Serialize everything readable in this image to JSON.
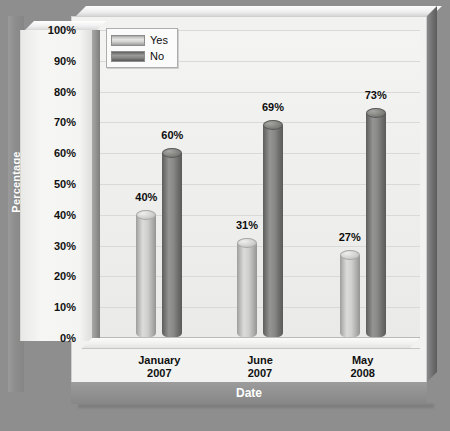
{
  "chart_data": {
    "type": "bar",
    "title": "",
    "xlabel": "Date",
    "ylabel": "Percentage",
    "categories": [
      "January\n2007",
      "June\n2007",
      "May\n2008"
    ],
    "category_lines": [
      [
        "January",
        "2007"
      ],
      [
        "June",
        "2007"
      ],
      [
        "May",
        "2008"
      ]
    ],
    "series": [
      {
        "name": "Yes",
        "values": [
          40,
          31,
          27
        ],
        "value_labels": [
          "40%",
          "31%",
          "27%"
        ],
        "color": "#cfcfcd"
      },
      {
        "name": "No",
        "values": [
          60,
          69,
          73
        ],
        "value_labels": [
          "60%",
          "69%",
          "73%"
        ],
        "color": "#7a7a78"
      }
    ],
    "ylim": [
      0,
      100
    ],
    "ytick_values": [
      0,
      10,
      20,
      30,
      40,
      50,
      60,
      70,
      80,
      90,
      100
    ],
    "ytick_labels": [
      "0%",
      "10%",
      "20%",
      "30%",
      "40%",
      "50%",
      "60%",
      "70%",
      "80%",
      "90%",
      "100%"
    ],
    "grid": true,
    "legend_position": "top-left",
    "style": "3d-cylinder-grayscale"
  },
  "legend": {
    "items": [
      {
        "label": "Yes",
        "swatch": "yes"
      },
      {
        "label": "No",
        "swatch": "no"
      }
    ]
  },
  "axes": {
    "y_title": "Percentage",
    "x_title": "Date"
  },
  "colors": {
    "background": "#8e8e8e",
    "plot_background": "#f1f1ef",
    "gridline": "#d9d9d7",
    "yes_bar": "#cfcfcd",
    "no_bar": "#7a7a78",
    "axis_band": "#909090",
    "label_text": "#101010",
    "band_text": "#ffffff"
  }
}
